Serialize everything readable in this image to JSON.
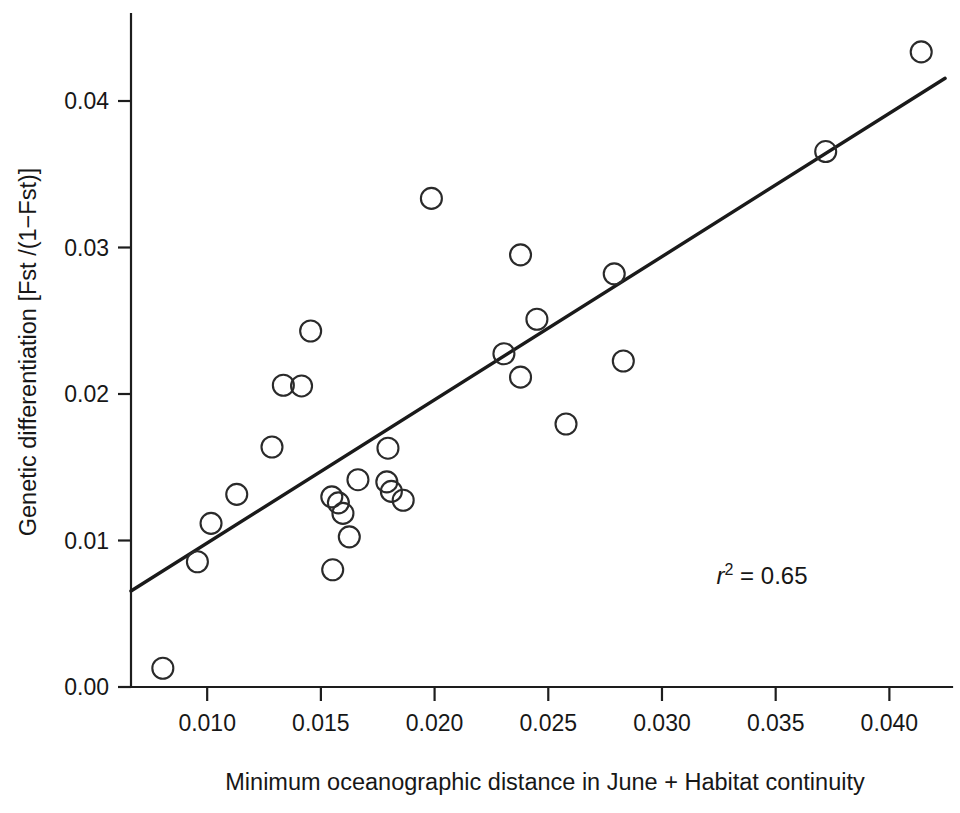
{
  "chart_data": {
    "type": "scatter",
    "title": "",
    "xlabel": "Minimum oceanographic distance in June + Habitat continuity",
    "ylabel": "Genetic differentiation [Fst /(1−Fst)]",
    "xlim": [
      0.00665,
      0.04245
    ],
    "ylim": [
      -0.0009,
      0.0458
    ],
    "grid": false,
    "legend": "none",
    "x_ticks": [
      0.01,
      0.015,
      0.02,
      0.025,
      0.03,
      0.035,
      0.04
    ],
    "x_tick_labels": [
      "0.010",
      "0.015",
      "0.020",
      "0.025",
      "0.030",
      "0.035",
      "0.040"
    ],
    "y_ticks": [
      0.0,
      0.01,
      0.02,
      0.03,
      0.04
    ],
    "y_tick_labels": [
      "0.00",
      "0.01",
      "0.02",
      "0.03",
      "0.04"
    ],
    "marker": "open-circle",
    "points": [
      {
        "x": 0.00805,
        "y": 0.00128
      },
      {
        "x": 0.00957,
        "y": 0.00855
      },
      {
        "x": 0.01017,
        "y": 0.01117
      },
      {
        "x": 0.0113,
        "y": 0.01315
      },
      {
        "x": 0.01285,
        "y": 0.01638
      },
      {
        "x": 0.01335,
        "y": 0.0206
      },
      {
        "x": 0.01415,
        "y": 0.02055
      },
      {
        "x": 0.01455,
        "y": 0.0243
      },
      {
        "x": 0.01548,
        "y": 0.01298
      },
      {
        "x": 0.01577,
        "y": 0.01257
      },
      {
        "x": 0.01597,
        "y": 0.01185
      },
      {
        "x": 0.01552,
        "y": 0.008
      },
      {
        "x": 0.01625,
        "y": 0.01025
      },
      {
        "x": 0.01663,
        "y": 0.01415
      },
      {
        "x": 0.0179,
        "y": 0.014
      },
      {
        "x": 0.0181,
        "y": 0.01335
      },
      {
        "x": 0.01795,
        "y": 0.0163
      },
      {
        "x": 0.01862,
        "y": 0.01275
      },
      {
        "x": 0.01986,
        "y": 0.03335
      },
      {
        "x": 0.02305,
        "y": 0.02275
      },
      {
        "x": 0.02378,
        "y": 0.0295
      },
      {
        "x": 0.02378,
        "y": 0.02115
      },
      {
        "x": 0.0245,
        "y": 0.0251
      },
      {
        "x": 0.02578,
        "y": 0.01795
      },
      {
        "x": 0.0279,
        "y": 0.0282
      },
      {
        "x": 0.0283,
        "y": 0.02225
      },
      {
        "x": 0.0372,
        "y": 0.03655
      },
      {
        "x": 0.0414,
        "y": 0.04335
      }
    ],
    "fit_line": {
      "label": "regression line",
      "x_start": 0.00665,
      "y_start": 0.00655,
      "x_end": 0.04245,
      "y_end": 0.04155
    },
    "annotations": [
      {
        "name": "r-squared",
        "text_italic": "r",
        "text_sup": "2",
        "text_rest": " = 0.65",
        "text": "r² = 0.65",
        "x": 0.0324,
        "y": 0.007
      }
    ]
  }
}
